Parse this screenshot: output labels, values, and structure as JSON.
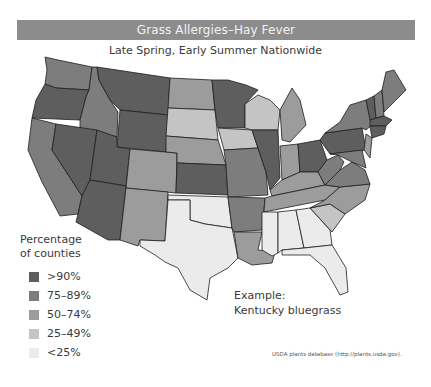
{
  "header": {
    "title": "Grass Allergies–Hay Fever",
    "subtitle": "Late Spring, Early Summer Nationwide"
  },
  "legend": {
    "title_line1": "Percentage",
    "title_line2": "of counties",
    "items": [
      {
        "label": ">90%",
        "color": "#5e5e5e"
      },
      {
        "label": "75–89%",
        "color": "#7d7d7d"
      },
      {
        "label": "50–74%",
        "color": "#9c9c9c"
      },
      {
        "label": "25–49%",
        "color": "#c4c4c4"
      },
      {
        "label": "<25%",
        "color": "#ebebeb"
      }
    ]
  },
  "example": {
    "line1": "Example:",
    "line2": "Kentucky bluegrass"
  },
  "source": "USDA plants database (http://plants.usda.gov).",
  "map": {
    "states": {
      "WA": "75–89%",
      "OR": ">90%",
      "CA": "75–89%",
      "ID": "75–89%",
      "NV": ">90%",
      "MT": ">90%",
      "WY": ">90%",
      "UT": ">90%",
      "AZ": ">90%",
      "CO": "50–74%",
      "NM": "50–74%",
      "ND": "50–74%",
      "SD": "25–49%",
      "NE": "50–74%",
      "KS": ">90%",
      "OK": "<25%",
      "TX": "<25%",
      "MN": ">90%",
      "IA": "25–49%",
      "MO": "75–89%",
      "AR": "75–89%",
      "LA": "50–74%",
      "WI": "25–49%",
      "IL": ">90%",
      "MI": "50–74%",
      "IN": "50–74%",
      "OH": ">90%",
      "KY": "50–74%",
      "TN": "50–74%",
      "MS": "<25%",
      "AL": "<25%",
      "GA": "<25%",
      "FL": "<25%",
      "SC": "25–49%",
      "NC": "50–74%",
      "VA": "75–89%",
      "WV": "75–89%",
      "PA": ">90%",
      "NY": "75–89%",
      "VT": ">90%",
      "NH": "75–89%",
      "ME": "75–89%",
      "MA": ">90%",
      "CT": ">90%",
      "NJ": "50–74%",
      "MD": "75–89%",
      "DE": "75–89%"
    }
  }
}
